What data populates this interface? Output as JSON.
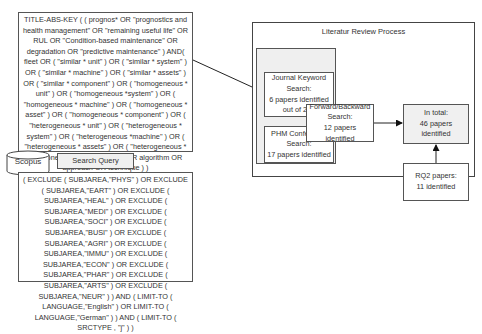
{
  "search_query_box": {
    "text": "TITLE-ABS-KEY ( ( prognos* OR \"prognostics and health management\" OR \"remaining useful life\" OR RUL OR \"Condition-based maintenance\" OR degradation OR \"predictive maintenance\" ) AND( fleet OR ( \"similar * unit\" ) OR ( \"similar * system\" ) OR ( \"similar * machine\" ) OR ( \"similar * assets\" ) OR ( \"similar * component\" ) OR ( \"homogeneous * unit\" ) OR ( \"homogeneous *system\" ) OR ( \"homogeneous * machine\" ) OR ( \"homogeneous * asset\" ) OR ( \"homogeneous * component\" ) OR ( \"heterogeneous * unit\" ) OR ( \"heterogeneous * system\" ) OR ( \"heterogeneous *machine\" ) OR ( \"heterogeneous * assets\" ) OR ( \"heterogeneous * component\" ) ) AND ( method OR algorithm OR approach OR technique ) )"
  },
  "database": {
    "label": "Scopus"
  },
  "search_query_label": "Search Query",
  "exclusion_box": {
    "text": "( EXCLUDE ( SUBJAREA,\"PHYS\" ) OR EXCLUDE ( SUBJAREA,\"EART\" ) OR EXCLUDE ( SUBJAREA,\"HEAL\" ) OR EXCLUDE ( SUBJAREA,\"MEDI\" ) OR EXCLUDE ( SUBJAREA,\"SOCI\" ) OR EXCLUDE ( SUBJAREA,\"BUSI\" ) OR EXCLUDE ( SUBJAREA,\"AGRI\" ) OR EXCLUDE ( SUBJAREA,\"IMMU\" ) OR EXCLUDE ( SUBJAREA,\"ECON\" ) OR EXCLUDE ( SUBJAREA,\"PHAR\" ) OR EXCLUDE ( SUBJAREA,\"ARTS\" ) OR EXCLUDE ( SUBJAREA,\"NEUR\" ) ) AND ( LIMIT-TO ( LANGUAGE,\"English\" ) OR LIMIT-TO ( LANGUAGE,\"German\" ) ) AND ( LIMIT-TO ( SRCTYPE , \"j\" ) )"
  },
  "process": {
    "title": "Literatur Review Process",
    "starting_literature_label": "Starting Literature",
    "journal_keyword": {
      "line1": "Journal Keyword",
      "line2": "Search:",
      "line3": "6 papers identified",
      "line4": "out of 279"
    },
    "phm_conference": {
      "line1": "PHM Conference",
      "line2": "Search:",
      "line3": "17 papers identified"
    },
    "forward_backward": {
      "line1": "Forward/Backward",
      "line2": "Search:",
      "line3": "12 papers identified"
    },
    "total": {
      "line1": "In total:",
      "line2": "46 papers identified"
    },
    "rq2": {
      "line1": "RQ2 papers:",
      "line2": "11 identified"
    }
  }
}
